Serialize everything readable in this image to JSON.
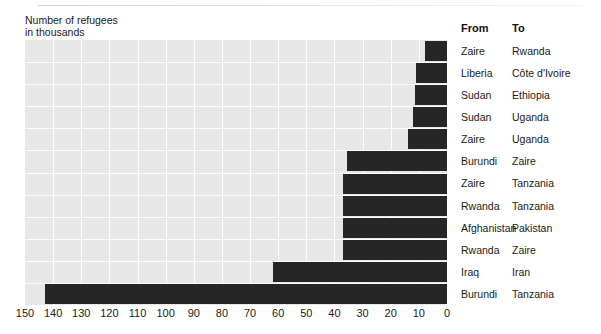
{
  "axis_title": "Number of refugees\nin thousands",
  "legend": {
    "header_from": "From",
    "header_to": "To"
  },
  "chart_data": {
    "type": "bar",
    "orientation": "horizontal-reversed",
    "title": "",
    "subtitle": "",
    "xlabel": "Number of refugees in thousands",
    "ylabel": "",
    "xlim": [
      150,
      0
    ],
    "x_direction": "descending-left-to-right",
    "grid": true,
    "legend_position": "right-table",
    "xticks": [
      150,
      140,
      130,
      120,
      110,
      100,
      90,
      80,
      70,
      60,
      50,
      40,
      30,
      20,
      10,
      0
    ],
    "xtick_labels": [
      "150",
      "140",
      "130",
      "120",
      "110",
      "100",
      "90",
      "80",
      "70",
      "60",
      "50",
      "40",
      "30",
      "20",
      "10",
      "0"
    ],
    "categories": [
      "Zaire → Rwanda",
      "Liberia → Côte d'Ivoire",
      "Sudan → Ethiopia",
      "Sudan → Uganda",
      "Zaire → Uganda",
      "Burundi → Zaire",
      "Zaire → Tanzania",
      "Rwanda → Tanzania",
      "Afghanistan → Pakistan",
      "Rwanda → Zaire",
      "Iraq → Iran",
      "Burundi → Tanzania"
    ],
    "values": [
      8,
      11,
      11.5,
      12,
      14,
      35.5,
      37,
      37,
      37,
      37,
      62,
      143
    ],
    "bar_color": "#262626",
    "plot_background": "#e7e7e7",
    "gridline_color": "#fdfdfd",
    "rows": [
      {
        "from": "Zaire",
        "to": "Rwanda",
        "value": 8
      },
      {
        "from": "Liberia",
        "to": "Côte d'Ivoire",
        "value": 11
      },
      {
        "from": "Sudan",
        "to": "Ethiopia",
        "value": 11.5
      },
      {
        "from": "Sudan",
        "to": "Uganda",
        "value": 12
      },
      {
        "from": "Zaire",
        "to": "Uganda",
        "value": 14
      },
      {
        "from": "Burundi",
        "to": "Zaire",
        "value": 35.5
      },
      {
        "from": "Zaire",
        "to": "Tanzania",
        "value": 37
      },
      {
        "from": "Rwanda",
        "to": "Tanzania",
        "value": 37
      },
      {
        "from": "Afghanistan",
        "to": "Pakistan",
        "value": 37
      },
      {
        "from": "Rwanda",
        "to": "Zaire",
        "value": 37
      },
      {
        "from": "Iraq",
        "to": "Iran",
        "value": 62
      },
      {
        "from": "Burundi",
        "to": "Tanzania",
        "value": 143
      }
    ]
  }
}
